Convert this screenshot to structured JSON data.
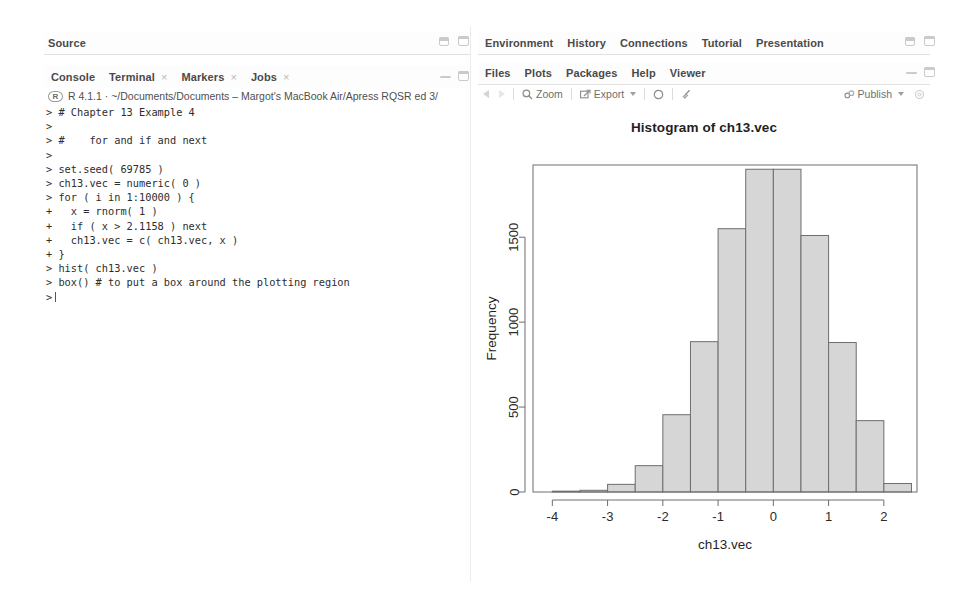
{
  "source_pane": {
    "tabs": [
      {
        "label": "Source",
        "closable": false
      }
    ],
    "controls": [
      "minimize-icon",
      "maximize-icon"
    ]
  },
  "console_pane": {
    "tabs": [
      {
        "label": "Console",
        "closable": false
      },
      {
        "label": "Terminal",
        "closable": true
      },
      {
        "label": "Markers",
        "closable": true
      },
      {
        "label": "Jobs",
        "closable": true
      }
    ],
    "controls": [
      "minimize-icon",
      "maximize-icon"
    ],
    "r_logo": "R",
    "version_path": "R 4.1.1 · ~/Documents/Documents – Margot's MacBook Air/Apress RQSR ed 3/",
    "code": "> # Chapter 13 Example 4\n>\n> #    for and if and next\n>\n> set.seed( 69785 )\n> ch13.vec = numeric( 0 )\n> for ( i in 1:10000 ) {\n+   x = rnorm( 1 )\n+   if ( x > 2.1158 ) next\n+   ch13.vec = c( ch13.vec, x )\n+ }\n> hist( ch13.vec )\n> box() # to put a box around the plotting region\n>"
  },
  "environment_pane": {
    "tabs": [
      {
        "label": "Environment",
        "closable": false
      },
      {
        "label": "History",
        "closable": false
      },
      {
        "label": "Connections",
        "closable": false
      },
      {
        "label": "Tutorial",
        "closable": false
      },
      {
        "label": "Presentation",
        "closable": false
      }
    ],
    "controls": [
      "minimize-icon",
      "maximize-icon"
    ]
  },
  "files_pane": {
    "tabs": [
      {
        "label": "Files",
        "closable": false
      },
      {
        "label": "Plots",
        "closable": false
      },
      {
        "label": "Packages",
        "closable": false
      },
      {
        "label": "Help",
        "closable": false
      },
      {
        "label": "Viewer",
        "closable": false
      }
    ],
    "controls": [
      "minimize-icon",
      "maximize-icon"
    ]
  },
  "plot_toolbar": {
    "back_label": "",
    "forward_label": "",
    "zoom_label": "Zoom",
    "export_label": "Export",
    "refresh_label": "",
    "clear_label": "",
    "publish_label": "Publish"
  },
  "chart_data": {
    "type": "bar",
    "title": "Histogram of ch13.vec",
    "xlabel": "ch13.vec",
    "ylabel": "Frequency",
    "grid": false,
    "legend": null,
    "xlim": [
      -4.35,
      2.6
    ],
    "ylim": [
      0,
      1925
    ],
    "xticks": [
      -4,
      -3,
      -2,
      -1,
      0,
      1,
      2
    ],
    "yticks": [
      0,
      500,
      1000,
      1500
    ],
    "bin_width": 0.5,
    "bin_edges": [
      -4.0,
      -3.5,
      -3.0,
      -2.5,
      -2.0,
      -1.5,
      -1.0,
      -0.5,
      0.0,
      0.5,
      1.0,
      1.5,
      2.0,
      2.5
    ],
    "categories": [
      "-4.0 to -3.5",
      "-3.5 to -3.0",
      "-3.0 to -2.5",
      "-2.5 to -2.0",
      "-2.0 to -1.5",
      "-1.5 to -1.0",
      "-1.0 to -0.5",
      "-0.5 to 0.0",
      "0.0 to 0.5",
      "0.5 to 1.0",
      "1.0 to 1.5",
      "1.5 to 2.0",
      "2.0 to 2.5"
    ],
    "values": [
      5,
      10,
      45,
      155,
      455,
      885,
      1550,
      1900,
      1900,
      1510,
      880,
      420,
      50
    ]
  }
}
